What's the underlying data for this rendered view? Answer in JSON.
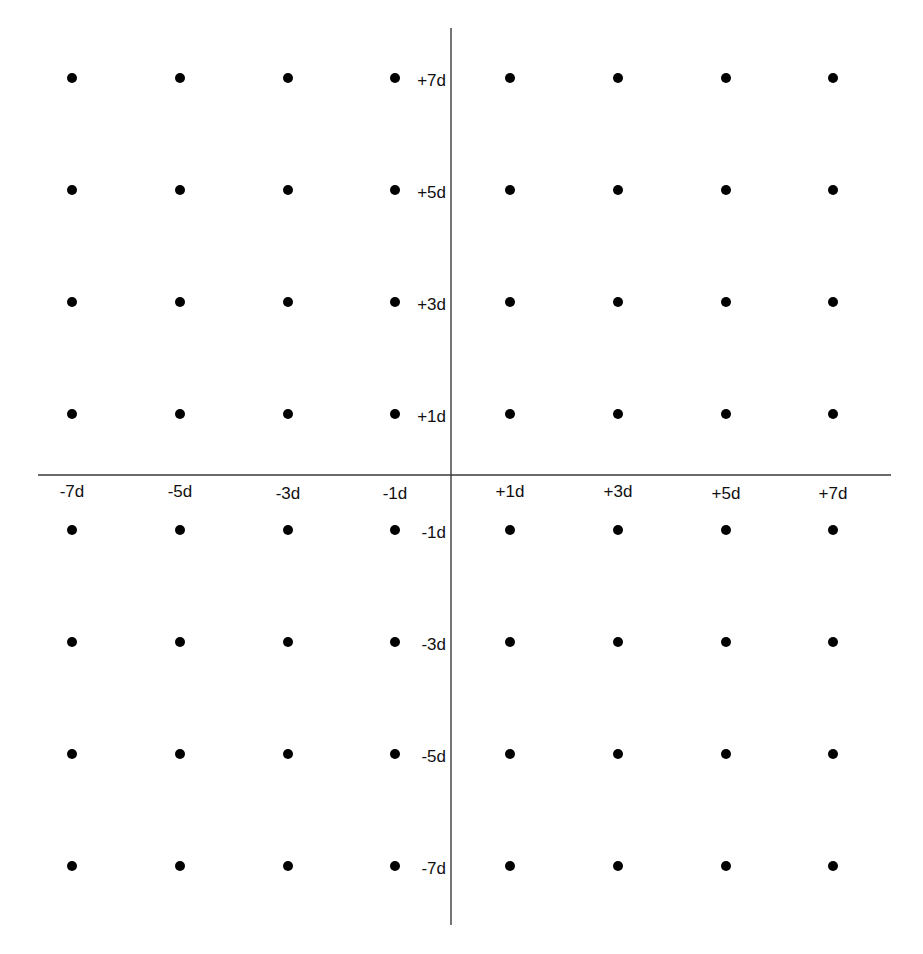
{
  "diagram": {
    "type": "64-QAM constellation",
    "colors": {
      "background": "#ffffff",
      "axis": "#3a3a3a",
      "point": "#000000",
      "label": "#111111"
    },
    "x_axis": {
      "labels": [
        "-7d",
        "-5d",
        "-3d",
        "-1d",
        "+1d",
        "+3d",
        "+5d",
        "+7d"
      ]
    },
    "y_axis": {
      "labels": [
        "+7d",
        "+5d",
        "+3d",
        "+1d",
        "-1d",
        "-3d",
        "-5d",
        "-7d"
      ]
    },
    "grid": {
      "columns": 8,
      "rows": 8,
      "total_points": 64
    }
  },
  "chart_data": {
    "type": "scatter",
    "title": "",
    "xlabel": "",
    "ylabel": "",
    "x_tick_labels": [
      "-7d",
      "-5d",
      "-3d",
      "-1d",
      "+1d",
      "+3d",
      "+5d",
      "+7d"
    ],
    "y_tick_labels": [
      "+7d",
      "+5d",
      "+3d",
      "+1d",
      "-1d",
      "-3d",
      "-5d",
      "-7d"
    ],
    "xlim": [
      -8,
      8
    ],
    "ylim": [
      -8,
      8
    ],
    "grid": false,
    "legend": null,
    "unit": "d",
    "x_levels": [
      -7,
      -5,
      -3,
      -1,
      1,
      3,
      5,
      7
    ],
    "y_levels": [
      7,
      5,
      3,
      1,
      -1,
      -3,
      -5,
      -7
    ],
    "series": [
      {
        "name": "constellation points",
        "points": [
          [
            -7,
            7
          ],
          [
            -5,
            7
          ],
          [
            -3,
            7
          ],
          [
            -1,
            7
          ],
          [
            1,
            7
          ],
          [
            3,
            7
          ],
          [
            5,
            7
          ],
          [
            7,
            7
          ],
          [
            -7,
            5
          ],
          [
            -5,
            5
          ],
          [
            -3,
            5
          ],
          [
            -1,
            5
          ],
          [
            1,
            5
          ],
          [
            3,
            5
          ],
          [
            5,
            5
          ],
          [
            7,
            5
          ],
          [
            -7,
            3
          ],
          [
            -5,
            3
          ],
          [
            -3,
            3
          ],
          [
            -1,
            3
          ],
          [
            1,
            3
          ],
          [
            3,
            3
          ],
          [
            5,
            3
          ],
          [
            7,
            3
          ],
          [
            -7,
            1
          ],
          [
            -5,
            1
          ],
          [
            -3,
            1
          ],
          [
            -1,
            1
          ],
          [
            1,
            1
          ],
          [
            3,
            1
          ],
          [
            5,
            1
          ],
          [
            7,
            1
          ],
          [
            -7,
            -1
          ],
          [
            -5,
            -1
          ],
          [
            -3,
            -1
          ],
          [
            -1,
            -1
          ],
          [
            1,
            -1
          ],
          [
            3,
            -1
          ],
          [
            5,
            -1
          ],
          [
            7,
            -1
          ],
          [
            -7,
            -3
          ],
          [
            -5,
            -3
          ],
          [
            -3,
            -3
          ],
          [
            -1,
            -3
          ],
          [
            1,
            -3
          ],
          [
            3,
            -3
          ],
          [
            5,
            -3
          ],
          [
            7,
            -3
          ],
          [
            -7,
            -5
          ],
          [
            -5,
            -5
          ],
          [
            -3,
            -5
          ],
          [
            -1,
            -5
          ],
          [
            1,
            -5
          ],
          [
            3,
            -5
          ],
          [
            5,
            -5
          ],
          [
            7,
            -5
          ],
          [
            -7,
            -7
          ],
          [
            -5,
            -7
          ],
          [
            -3,
            -7
          ],
          [
            -1,
            -7
          ],
          [
            1,
            -7
          ],
          [
            3,
            -7
          ],
          [
            5,
            -7
          ],
          [
            7,
            -7
          ]
        ]
      }
    ]
  }
}
